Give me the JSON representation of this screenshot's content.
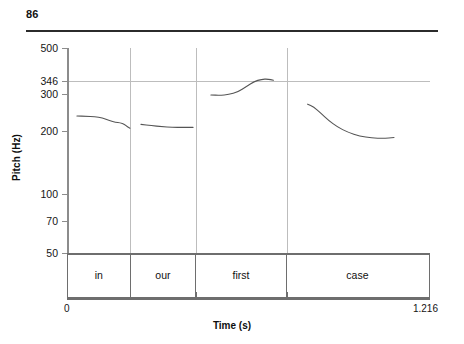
{
  "page": {
    "page_number": "86"
  },
  "chart_data": {
    "type": "line",
    "title": "",
    "xlabel": "Time (s)",
    "ylabel": "Pitch (Hz)",
    "xlim": [
      0,
      1.216
    ],
    "ylim": [
      50,
      500
    ],
    "yscale": "log",
    "grid": true,
    "legend": "none",
    "x_tick_labels": [
      "0",
      "1.216"
    ],
    "y_tick_labels": [
      "500",
      "346",
      "300",
      "200",
      "100",
      "70",
      "50"
    ],
    "y_ticks": [
      500,
      346,
      300,
      200,
      100,
      70,
      50
    ],
    "highlight_gridlines": [
      346,
      50
    ],
    "annotations": [
      {
        "label": "in",
        "t_start": 0.003,
        "t_end": 0.214
      },
      {
        "label": "our",
        "t_start": 0.214,
        "t_end": 0.435
      },
      {
        "label": "first",
        "t_start": 0.435,
        "t_end": 0.74
      },
      {
        "label": "case",
        "t_start": 0.74,
        "t_end": 1.216
      }
    ],
    "series": [
      {
        "name": "pitch-contour-in",
        "points": [
          [
            0.03,
            233
          ],
          [
            0.06,
            232
          ],
          [
            0.09,
            231
          ],
          [
            0.115,
            228
          ],
          [
            0.14,
            221
          ],
          [
            0.16,
            217
          ],
          [
            0.175,
            216
          ],
          [
            0.19,
            212
          ],
          [
            0.2,
            206
          ],
          [
            0.208,
            203
          ]
        ]
      },
      {
        "name": "pitch-contour-our",
        "points": [
          [
            0.245,
            212
          ],
          [
            0.28,
            209
          ],
          [
            0.315,
            207
          ],
          [
            0.35,
            205
          ],
          [
            0.385,
            205
          ],
          [
            0.42,
            205
          ]
        ]
      },
      {
        "name": "pitch-contour-first",
        "points": [
          [
            0.48,
            295
          ],
          [
            0.51,
            294
          ],
          [
            0.54,
            296
          ],
          [
            0.57,
            305
          ],
          [
            0.6,
            325
          ],
          [
            0.625,
            343
          ],
          [
            0.65,
            352
          ],
          [
            0.672,
            353
          ],
          [
            0.69,
            348
          ]
        ]
      },
      {
        "name": "pitch-contour-case",
        "points": [
          [
            0.805,
            266
          ],
          [
            0.825,
            258
          ],
          [
            0.85,
            240
          ],
          [
            0.875,
            222
          ],
          [
            0.905,
            206
          ],
          [
            0.94,
            194
          ],
          [
            0.98,
            186
          ],
          [
            1.02,
            182
          ],
          [
            1.06,
            181
          ],
          [
            1.095,
            183
          ]
        ]
      }
    ]
  }
}
